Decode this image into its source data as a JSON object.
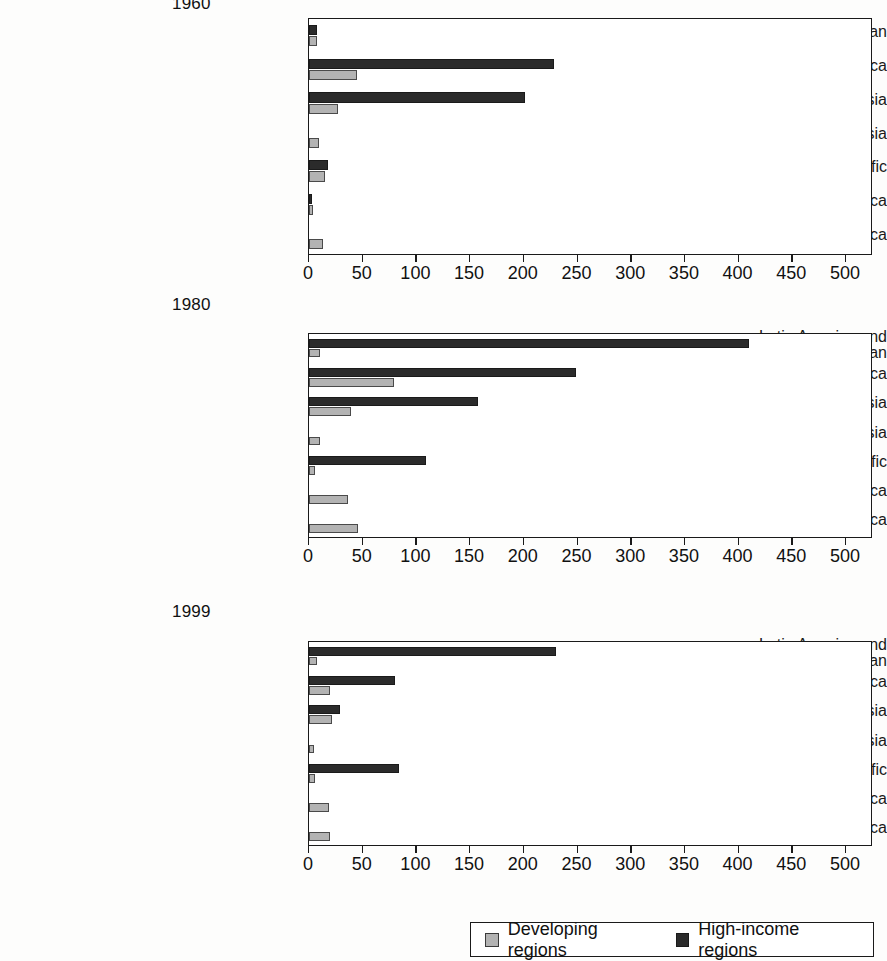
{
  "legend": {
    "items": [
      {
        "label": "Developing regions",
        "key": "developing",
        "color": "#b3b3b3",
        "swatch": "legend-swatch-developing"
      },
      {
        "label": "High-income regions",
        "key": "high_income",
        "color": "#2b2b2b",
        "swatch": "legend-swatch-high-income"
      }
    ]
  },
  "axis": {
    "ticks": [
      "0",
      "50",
      "100",
      "150",
      "200",
      "250",
      "300",
      "350",
      "400",
      "450",
      "500"
    ],
    "min": 0,
    "max": 520
  },
  "chart_data": [
    {
      "type": "bar",
      "orientation": "horizontal",
      "title": "1960",
      "xlabel": "",
      "ylabel": "",
      "xlim": [
        0,
        520
      ],
      "grid": false,
      "legend_position": "bottom",
      "categories": [
        "Latin America and the Caribbean",
        "Middle East/North Africa",
        "Europe and Central Asia",
        "South Asia",
        "East Asia and Pacific",
        "West Africa",
        "East and southern Africa"
      ],
      "series": [
        {
          "name": "High-income regions",
          "values": [
            7,
            228,
            201,
            0,
            18,
            3,
            0
          ]
        },
        {
          "name": "Developing regions",
          "values": [
            7,
            45,
            27,
            9,
            15,
            4,
            13
          ]
        }
      ]
    },
    {
      "type": "bar",
      "orientation": "horizontal",
      "title": "1980",
      "xlabel": "",
      "ylabel": "",
      "xlim": [
        0,
        520
      ],
      "grid": false,
      "legend_position": "bottom",
      "categories": [
        "Latin America and\nthe Caribbean",
        "Middle East/North Africa",
        "Europe and Central Asia",
        "South Asia",
        "East Asia and Pacific",
        "West Africa",
        "East and southern Africa"
      ],
      "series": [
        {
          "name": "High-income regions",
          "values": [
            410,
            249,
            157,
            0,
            109,
            0,
            0
          ]
        },
        {
          "name": "Developing regions",
          "values": [
            10,
            79,
            39,
            10,
            6,
            36,
            46
          ]
        }
      ]
    },
    {
      "type": "bar",
      "orientation": "horizontal",
      "title": "1999",
      "xlabel": "",
      "ylabel": "",
      "xlim": [
        0,
        520
      ],
      "grid": false,
      "legend_position": "bottom",
      "categories": [
        "Latin America and\nthe Caribbean",
        "Middle East/North Africa",
        "Europe and Central Asia",
        "South Asia",
        "East Asia and Pacific",
        "West Africa",
        "East and southern Africa"
      ],
      "series": [
        {
          "name": "High-income regions",
          "values": [
            230,
            80,
            29,
            0,
            84,
            0,
            0
          ]
        },
        {
          "name": "Developing regions",
          "values": [
            7,
            20,
            21,
            5,
            6,
            19,
            20
          ]
        }
      ]
    }
  ]
}
